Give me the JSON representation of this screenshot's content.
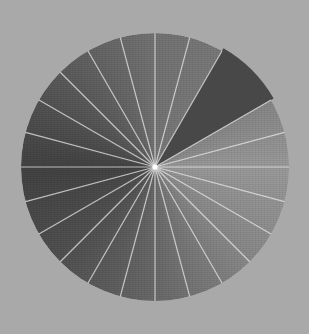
{
  "figure": {
    "kind": "radial-segment-disc",
    "caption": "Gray disc divided into radial wedges with a highlighted dark wedge",
    "background_color": "#a9a9a9",
    "center": [
      155,
      167
    ],
    "radius": 134,
    "segment_count": 24,
    "segment_angle_deg": 15,
    "divider_color": "#e8e8e8",
    "divider_width": 1.2,
    "center_dot_color": "#ffffff",
    "center_dot_radius": 2.5,
    "shading_stops": [
      {
        "angle_deg": 0,
        "color": "#747474"
      },
      {
        "angle_deg": 45,
        "color": "#7e7e7e"
      },
      {
        "angle_deg": 90,
        "color": "#9c9c9c"
      },
      {
        "angle_deg": 135,
        "color": "#8a8a8a"
      },
      {
        "angle_deg": 180,
        "color": "#6a6a6a"
      },
      {
        "angle_deg": 225,
        "color": "#525252"
      },
      {
        "angle_deg": 270,
        "color": "#434343"
      },
      {
        "angle_deg": 315,
        "color": "#5c5c5c"
      },
      {
        "angle_deg": 360,
        "color": "#747474"
      }
    ],
    "highlight_wedge": {
      "start_deg": 30,
      "end_deg": 60,
      "color": "#484848",
      "radius": 137,
      "has_divider": false
    },
    "omitted_divider_angles_deg": [
      45
    ]
  }
}
